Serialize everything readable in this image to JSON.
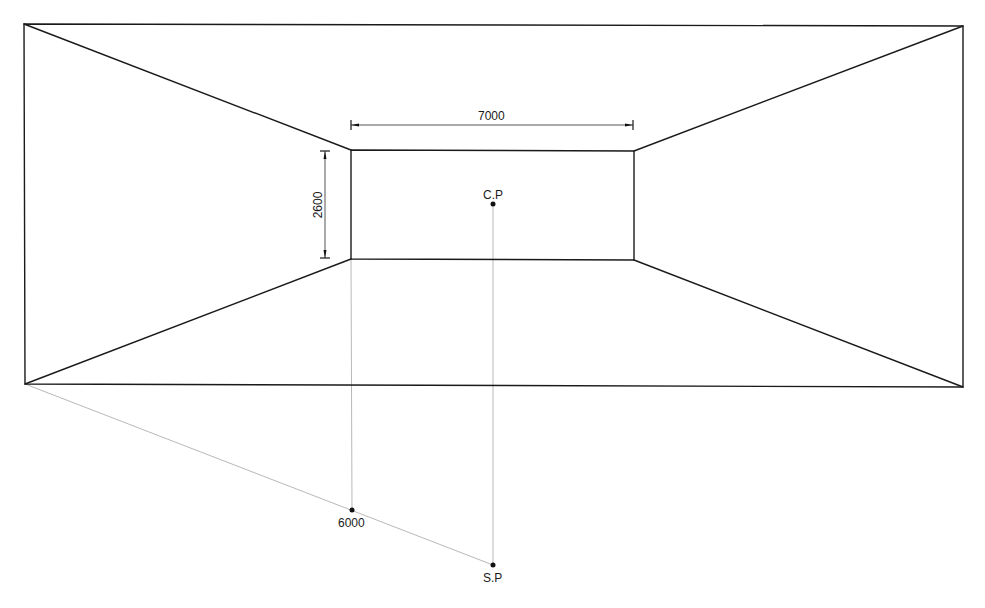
{
  "drawing": {
    "type": "one-point perspective construction of a room",
    "colors": {
      "edge": "#1a1a1a",
      "construction": "#b8b8b8",
      "background": "#ffffff"
    },
    "outer_frame": {
      "top_left": [
        24,
        24
      ],
      "top_right": [
        963,
        26
      ],
      "bottom_right": [
        963,
        387
      ],
      "bottom_left": [
        25,
        384
      ]
    },
    "back_wall": {
      "top_left": [
        351,
        150
      ],
      "top_right": [
        634,
        151
      ],
      "bottom_right": [
        634,
        260
      ],
      "bottom_left": [
        351,
        259
      ]
    },
    "dimensions": {
      "width": {
        "label": "7000",
        "y": 125,
        "x1": 351,
        "x2": 633
      },
      "height": {
        "label": "2600",
        "x": 325,
        "y1": 151,
        "y2": 258
      }
    },
    "points": {
      "center_point": {
        "label": "C.P",
        "x": 493,
        "y": 204
      },
      "station_point": {
        "label": "S.P",
        "x": 493,
        "y": 565
      },
      "distance_mark": {
        "label": "6000",
        "x": 352,
        "y": 510
      }
    }
  }
}
